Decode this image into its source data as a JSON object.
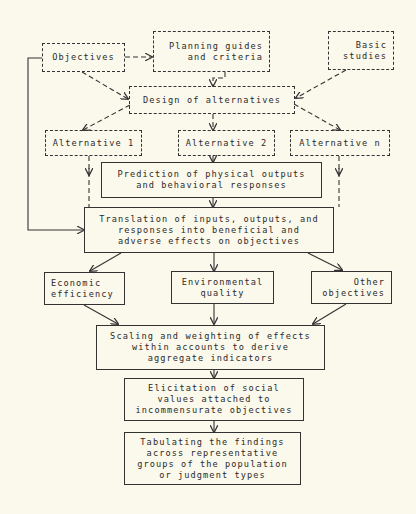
{
  "diagram": {
    "type": "flowchart",
    "background": "#fbf8ec",
    "line_color": "#333333",
    "nodes": {
      "objectives": {
        "lines": [
          "Objectives"
        ],
        "style": "dashed"
      },
      "planning": {
        "lines": [
          "Planning guides",
          "and criteria"
        ],
        "style": "dashed"
      },
      "basic": {
        "lines": [
          "Basic",
          "studies"
        ],
        "style": "dashed"
      },
      "design": {
        "lines": [
          "Design of alternatives"
        ],
        "style": "dashed"
      },
      "alt1": {
        "lines": [
          "Alternative 1"
        ],
        "style": "dashed"
      },
      "alt2": {
        "lines": [
          "Alternative 2"
        ],
        "style": "dashed"
      },
      "altn": {
        "lines": [
          "Alternative n"
        ],
        "style": "dashed"
      },
      "prediction": {
        "lines": [
          "Prediction of physical outputs",
          "and behavioral responses"
        ],
        "style": "solid"
      },
      "translation": {
        "lines": [
          "Translation of inputs, outputs, and",
          "responses into beneficial and",
          "adverse effects on objectives"
        ],
        "style": "solid"
      },
      "economic": {
        "lines": [
          "Economic",
          "efficiency"
        ],
        "style": "solid"
      },
      "environmental": {
        "lines": [
          "Environmental",
          "quality"
        ],
        "style": "solid"
      },
      "other": {
        "lines": [
          "Other",
          "objectives"
        ],
        "style": "solid"
      },
      "scaling": {
        "lines": [
          "Scaling and weighting of effects",
          "within accounts to derive",
          "aggregate indicators"
        ],
        "style": "solid"
      },
      "elicitation": {
        "lines": [
          "Elicitation of social",
          "values attached to",
          "incommensurate objectives"
        ],
        "style": "solid"
      },
      "tabulating": {
        "lines": [
          "Tabulating the findings",
          "across representative",
          "groups of the population",
          "or judgment types"
        ],
        "style": "solid"
      }
    },
    "edges": [
      {
        "from": "objectives",
        "to": "planning",
        "style": "dashed"
      },
      {
        "from": "objectives",
        "to": "design",
        "style": "dashed"
      },
      {
        "from": "planning",
        "to": "design",
        "style": "dashed"
      },
      {
        "from": "basic",
        "to": "design",
        "style": "dashed"
      },
      {
        "from": "design",
        "to": "alt1",
        "style": "dashed"
      },
      {
        "from": "design",
        "to": "alt2",
        "style": "dashed"
      },
      {
        "from": "design",
        "to": "altn",
        "style": "dashed"
      },
      {
        "from": "alt1",
        "to": "translation",
        "style": "dashed"
      },
      {
        "from": "alt2",
        "to": "prediction",
        "style": "solid"
      },
      {
        "from": "altn",
        "to": "translation",
        "style": "dashed"
      },
      {
        "from": "prediction",
        "to": "translation",
        "style": "solid"
      },
      {
        "from": "objectives",
        "to": "translation",
        "style": "solid"
      },
      {
        "from": "translation",
        "to": "economic",
        "style": "solid"
      },
      {
        "from": "translation",
        "to": "environmental",
        "style": "solid"
      },
      {
        "from": "translation",
        "to": "other",
        "style": "solid"
      },
      {
        "from": "economic",
        "to": "scaling",
        "style": "solid"
      },
      {
        "from": "environmental",
        "to": "scaling",
        "style": "solid"
      },
      {
        "from": "other",
        "to": "scaling",
        "style": "solid"
      },
      {
        "from": "scaling",
        "to": "elicitation",
        "style": "solid"
      },
      {
        "from": "elicitation",
        "to": "tabulating",
        "style": "solid"
      }
    ]
  }
}
